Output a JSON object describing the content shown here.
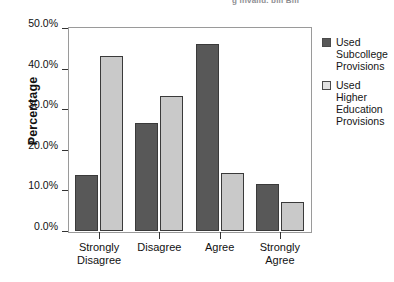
{
  "figure": {
    "scan_header_fragment": "g invalid. bill Bill",
    "legend": {
      "position": "right",
      "entries": [
        {
          "label": "Used Subcollege Provisions",
          "swatch": "dark",
          "color": "#585858"
        },
        {
          "label": "Used Higher Education Provisions",
          "swatch": "light",
          "color": "#e2e2e2"
        }
      ]
    }
  },
  "chart_data": {
    "type": "bar",
    "title": "",
    "xlabel": "",
    "ylabel": "Percentage",
    "categories": [
      "Strongly Disagree",
      "Disagree",
      "Agree",
      "Strongly Agree"
    ],
    "series": [
      {
        "name": "Used Subcollege Provisions",
        "color": "#585858",
        "values": [
          13.8,
          26.7,
          46.0,
          11.5
        ]
      },
      {
        "name": "Used Higher Education Provisions",
        "color": "#c9c9c9",
        "values": [
          43.1,
          33.2,
          14.2,
          7.2
        ]
      }
    ],
    "ylim": [
      0,
      50
    ],
    "ytick_values": [
      0,
      10,
      20,
      30,
      40,
      50
    ],
    "ytick_labels": [
      "0.0%",
      "10.0%",
      "20.0%",
      "30.0%",
      "40.0%",
      "50.0%"
    ],
    "grid": false,
    "value_format": "percent"
  }
}
